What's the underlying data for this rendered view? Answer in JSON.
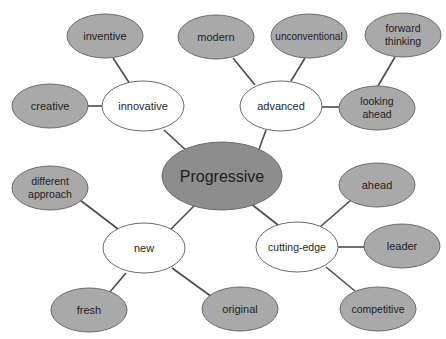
{
  "diagram": {
    "colors": {
      "center_fill": "#8d8d8d",
      "leaf_fill": "#a9a9a9",
      "mid_fill": "#ffffff",
      "stroke": "#6a6a6a",
      "edge": "#4a4a4a"
    },
    "center": {
      "label": "Progressive"
    },
    "branches": [
      {
        "label": "innovative",
        "leaves": [
          "inventive",
          "creative"
        ]
      },
      {
        "label": "advanced",
        "leaves": [
          "modern",
          "unconventional",
          "looking ahead"
        ],
        "subleaves": [
          "forward thinking"
        ]
      },
      {
        "label": "new",
        "leaves": [
          "different approach",
          "fresh",
          "original"
        ]
      },
      {
        "label": "cutting-edge",
        "leaves": [
          "ahead",
          "leader",
          "competitive"
        ]
      }
    ],
    "nodes": {
      "progressive": "Progressive",
      "innovative": "innovative",
      "inventive": "inventive",
      "creative": "creative",
      "advanced": "advanced",
      "modern": "modern",
      "unconventional": "unconventional",
      "forward_thinking_1": "forward",
      "forward_thinking_2": "thinking",
      "looking_ahead_1": "looking",
      "looking_ahead_2": "ahead",
      "new": "new",
      "different_approach_1": "different",
      "different_approach_2": "approach",
      "fresh": "fresh",
      "original": "original",
      "cutting_edge": "cutting-edge",
      "ahead": "ahead",
      "leader": "leader",
      "competitive": "competitive"
    }
  }
}
